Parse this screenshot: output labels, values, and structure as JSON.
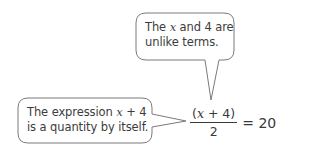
{
  "bubbles": [
    {
      "id": "top",
      "text_parts": [
        "The ",
        "x",
        " and 4 are unlike terms."
      ],
      "line1_a": "The ",
      "line1_var": "x",
      "line1_b": " and 4 are",
      "line2": "unlike terms."
    },
    {
      "id": "left",
      "line1_a": "The expression ",
      "line1_var": "x",
      "line1_b": " + 4",
      "line2": "is a quantity by itself."
    }
  ],
  "equation": {
    "numerator_open": "(",
    "numerator_var": "x",
    "numerator_rest": " + 4)",
    "denominator": "2",
    "rhs": "= 20"
  },
  "colors": {
    "bubble_stroke": "#7a7a7a",
    "bubble_fill": "#ffffff",
    "text": "#3a3a3a"
  }
}
